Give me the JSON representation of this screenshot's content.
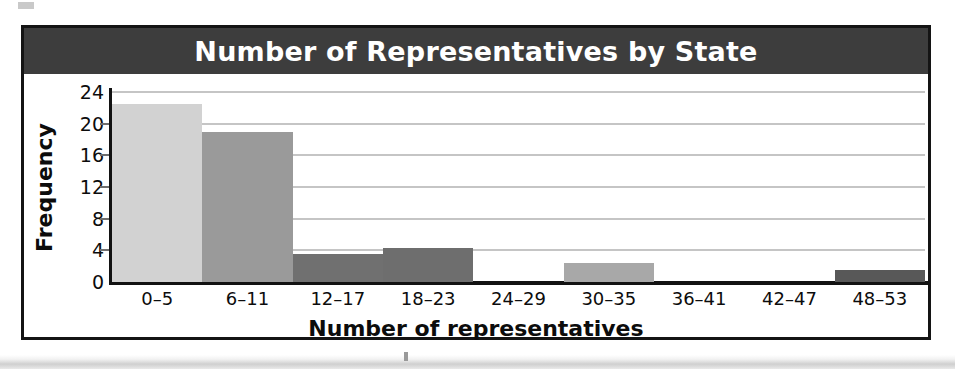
{
  "figure": {
    "title": "Number of Representatives by State",
    "title_band_color": "#3d3d3d",
    "title_text_color": "#ffffff",
    "frame_color": "#141414",
    "background_color": "#ffffff"
  },
  "chart_data": {
    "type": "bar",
    "title": "Number of Representatives by State",
    "xlabel": "Number of representatives",
    "ylabel": "Frequency",
    "categories": [
      "0–5",
      "6–11",
      "12–17",
      "18–23",
      "24–29",
      "30–35",
      "36–41",
      "42–47",
      "48–53"
    ],
    "values": [
      22.5,
      19,
      3.5,
      4.3,
      0,
      2.4,
      0,
      0,
      1.5
    ],
    "bar_colors": [
      "#d2d2d2",
      "#9a9a9a",
      "#707070",
      "#6e6e6e",
      "#ffffff",
      "#a8a8a8",
      "#ffffff",
      "#ffffff",
      "#585858"
    ],
    "ylim": [
      0,
      24
    ],
    "yticks": [
      0,
      4,
      8,
      12,
      16,
      20,
      24
    ],
    "ytick_labels": [
      "0",
      "4",
      "8",
      "12",
      "16",
      "20",
      "24"
    ],
    "grid": true,
    "grid_color": "#8c8c8c",
    "legend": null,
    "legend_position": "none"
  }
}
